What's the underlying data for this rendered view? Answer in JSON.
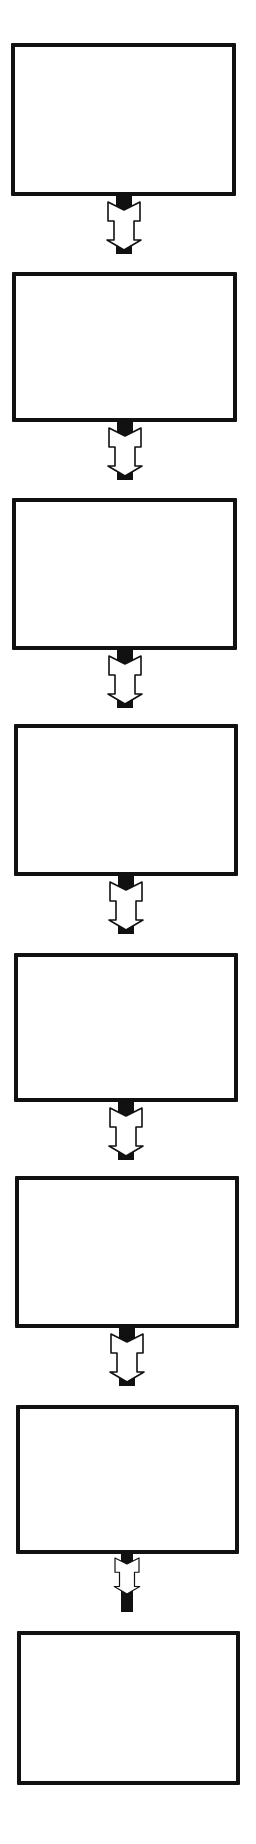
{
  "diagram": {
    "type": "vertical-flowchart",
    "colors": {
      "stroke": "#111111",
      "fill": "#ffffff",
      "connector": "#111111"
    },
    "boxes": [
      {
        "label": "",
        "x": 11,
        "y": 43,
        "w": 225,
        "h": 153
      },
      {
        "label": "",
        "x": 12,
        "y": 272,
        "w": 225,
        "h": 150
      },
      {
        "label": "",
        "x": 12,
        "y": 498,
        "w": 225,
        "h": 152
      },
      {
        "label": "",
        "x": 14,
        "y": 724,
        "w": 224,
        "h": 152
      },
      {
        "label": "",
        "x": 14,
        "y": 953,
        "w": 224,
        "h": 149
      },
      {
        "label": "",
        "x": 15,
        "y": 1176,
        "w": 224,
        "h": 152
      },
      {
        "label": "",
        "x": 16,
        "y": 1405,
        "w": 223,
        "h": 149
      },
      {
        "label": "",
        "x": 17,
        "y": 1631,
        "w": 223,
        "h": 154
      }
    ],
    "connectors": [
      {
        "from": 0,
        "to": 1,
        "icon": "down-arrow-icon",
        "x": 104,
        "y": 194
      },
      {
        "from": 1,
        "to": 2,
        "icon": "down-arrow-icon",
        "x": 105,
        "y": 420
      },
      {
        "from": 2,
        "to": 3,
        "icon": "down-arrow-icon",
        "x": 105,
        "y": 648
      },
      {
        "from": 3,
        "to": 4,
        "icon": "down-arrow-icon",
        "x": 106,
        "y": 874
      },
      {
        "from": 4,
        "to": 5,
        "icon": "down-arrow-icon",
        "x": 106,
        "y": 1100
      },
      {
        "from": 5,
        "to": 6,
        "icon": "down-arrow-icon",
        "x": 107,
        "y": 1326
      },
      {
        "from": 6,
        "to": 7,
        "icon": "down-arrow-icon",
        "x": 107,
        "y": 1552
      }
    ]
  }
}
